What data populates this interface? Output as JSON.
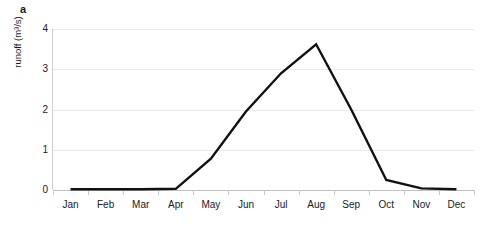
{
  "figure": {
    "panel_label": "a",
    "background_color": "#ffffff",
    "line_color": "#111111",
    "gridline_color": "#e9e9e9",
    "axis_color": "#bfbfbf"
  },
  "chart_data": {
    "type": "line",
    "title": "",
    "subtitle": "",
    "xlabel": "",
    "ylabel": "runoff (m³/s)",
    "categories": [
      "Jan",
      "Feb",
      "Mar",
      "Apr",
      "May",
      "Jun",
      "Jul",
      "Aug",
      "Sep",
      "Oct",
      "Nov",
      "Dec"
    ],
    "series": [
      {
        "name": "runoff",
        "values": [
          0.02,
          0.02,
          0.02,
          0.03,
          0.78,
          1.95,
          2.9,
          3.62,
          2.0,
          0.25,
          0.04,
          0.02
        ]
      }
    ],
    "ylim": [
      0,
      4
    ],
    "yticks": [
      0,
      1,
      2,
      3,
      4
    ],
    "ytick_labels": [
      "0",
      "1",
      "2",
      "3",
      "4"
    ],
    "grid": "horizontal",
    "legend": "none",
    "annotations": []
  }
}
